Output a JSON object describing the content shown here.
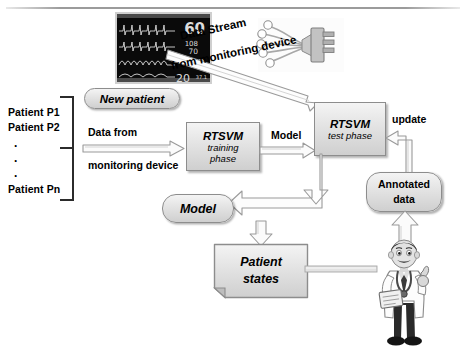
{
  "diagram": {
    "patients": {
      "p1": "Patient P1",
      "p2": "Patient P2",
      "dot1": ".",
      "dot2": ".",
      "dot3": ".",
      "pn": "Patient Pn"
    },
    "monitor": {
      "heart_rate": "60",
      "bp_systolic": "108",
      "bp_diastolic": "70",
      "spo2": "98",
      "resp_rate": "20",
      "unit_small": "37.1"
    },
    "nodes": {
      "new_patient": "New patient",
      "rtsvm_training_l1": "RTSVM",
      "rtsvm_training_l2": "training",
      "rtsvm_training_l3": "phase",
      "rtsvm_test_l1": "RTSVM",
      "rtsvm_test_l2": "test phase",
      "annotated_l1": "Annotated",
      "annotated_l2": "data",
      "model": "Model",
      "patient_states_l1": "Patient",
      "patient_states_l2": "states"
    },
    "labels": {
      "data_stream_l1": "Data Stream",
      "data_stream_l2": "from monitoring device",
      "data_from_l1": "Data from",
      "data_from_l2": "monitoring device",
      "model_arrow": "Model",
      "update_arrow": "update"
    },
    "icons": {
      "monitor": "patient-monitor-icon",
      "electrodes": "ecg-electrode-cable-icon",
      "doctor": "doctor-figure-icon"
    },
    "colors": {
      "node_fill_light": "#f4f4f4",
      "node_fill_dark": "#cfcfcf",
      "node_border": "#8d8d8d",
      "arrow_fill": "#fbfbfb",
      "arrow_border": "#8d8d8d",
      "text": "#000000",
      "monitor_screen": "#0a0a0a",
      "monitor_trace": "#dcdcdc"
    }
  }
}
